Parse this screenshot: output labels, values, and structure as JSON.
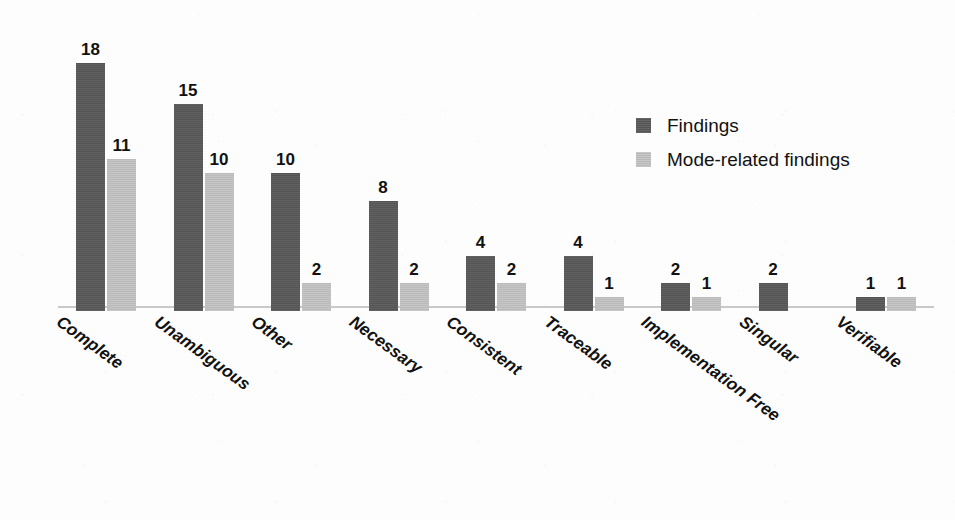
{
  "chart_data": {
    "type": "bar",
    "title": "",
    "subtitle": "",
    "xlabel": "",
    "ylabel": "",
    "ylim": [
      0,
      18
    ],
    "grid": false,
    "legend_position": "top-right",
    "value_labels": true,
    "categories": [
      "Complete",
      "Unambiguous",
      "Other",
      "Necessary",
      "Consistent",
      "Traceable",
      "Implementation Free",
      "Singular",
      "Verifiable"
    ],
    "series": [
      {
        "name": "Findings",
        "color": "#595959",
        "values": [
          18,
          15,
          10,
          8,
          4,
          4,
          2,
          2,
          1
        ]
      },
      {
        "name": "Mode-related findings",
        "color": "#c2c2c2",
        "values": [
          11,
          10,
          2,
          2,
          2,
          1,
          1,
          null,
          1
        ]
      }
    ]
  },
  "legend": {
    "items": [
      {
        "label": "Findings",
        "swatch": "dark-gray-swatch"
      },
      {
        "label": "Mode-related findings",
        "swatch": "light-gray-swatch"
      }
    ]
  },
  "axis": {
    "baseline_color": "#c9c9c9"
  },
  "colors": {
    "findings": "#595959",
    "mode_related_findings": "#c2c2c2",
    "background": "#fdfdfd",
    "text": "#111111"
  }
}
